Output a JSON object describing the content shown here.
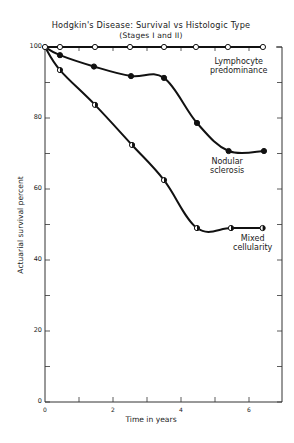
{
  "chart_data": {
    "type": "line",
    "title": "Hodgkin's Disease: Survival vs Histologic Type",
    "subtitle": "(Stages I and II)",
    "xlabel": "Time in years",
    "ylabel": "Actuarial survival percent",
    "xlim": [
      0,
      7
    ],
    "ylim": [
      0,
      100
    ],
    "x_ticks": [
      0,
      2,
      4,
      6
    ],
    "x_minor_ticks": [
      1,
      3,
      5
    ],
    "y_ticks": [
      0,
      20,
      40,
      60,
      80,
      100
    ],
    "y_minor_ticks": [
      10,
      30,
      50,
      70,
      90
    ],
    "grid": false,
    "legend_position": "inline labels",
    "series": [
      {
        "name": "Lymphocyte predominance",
        "marker": "open-circle",
        "x": [
          0,
          0.44,
          1.47,
          2.5,
          3.5,
          4.44,
          5.38,
          6.41
        ],
        "y": [
          100,
          100,
          100,
          100,
          100,
          100,
          100,
          100
        ]
      },
      {
        "name": "Nodular sclerosis",
        "marker": "filled-circle",
        "x": [
          0,
          0.44,
          1.44,
          2.53,
          3.5,
          4.47,
          5.4,
          6.44
        ],
        "y": [
          100,
          97.7,
          94.5,
          91.8,
          91.3,
          78.6,
          70.7,
          70.7
        ]
      },
      {
        "name": "Mixed cellularity",
        "marker": "half-circle",
        "x": [
          0,
          0.44,
          1.47,
          2.56,
          3.5,
          4.47,
          5.47,
          6.4
        ],
        "y": [
          100,
          93.5,
          83.7,
          72.4,
          62.5,
          49,
          49,
          49
        ]
      }
    ]
  },
  "labels": {
    "title": "Hodgkin's Disease: Survival vs Histologic Type",
    "subtitle": "(Stages I and II)",
    "xlabel": "Time in years",
    "ylabel": "Actuarial survival percent",
    "lymph_line1": "Lymphocyte",
    "lymph_line2": "predominance",
    "nodular_line1": "Nodular",
    "nodular_line2": "sclerosis",
    "mixed_line1": "Mixed",
    "mixed_line2": "cellularity"
  }
}
